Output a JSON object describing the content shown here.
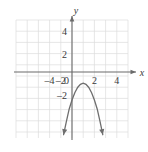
{
  "chart_data": {
    "type": "line",
    "title": "",
    "subtitle": "",
    "xlabel": "x",
    "ylabel": "y",
    "xlim": [
      -5.2,
      4.8
    ],
    "ylim": [
      -5.3,
      4.8
    ],
    "grid": true,
    "legend": null,
    "x_ticks": [
      -4,
      -2,
      0,
      2,
      4
    ],
    "x_tick_labels": [
      "–4",
      "–2",
      "0",
      "2",
      "4"
    ],
    "y_ticks": [
      4,
      2,
      -2
    ],
    "y_tick_labels": [
      "4",
      "2",
      "–2"
    ],
    "grid_step": 1,
    "series": [
      {
        "name": "downward parabola",
        "kind": "parabola",
        "opens": "down",
        "vertex": [
          1,
          -1
        ],
        "leading_coefficient": -1.5,
        "y_intercept": -2.5,
        "arrow_start": true,
        "arrow_end": true,
        "x_domain": [
          -0.75,
          2.75
        ],
        "points": [
          [
            -0.75,
            -5.6
          ],
          [
            -0.5,
            -4.4
          ],
          [
            -0.25,
            -3.3
          ],
          [
            0,
            -2.5
          ],
          [
            0.25,
            -1.85
          ],
          [
            0.5,
            -1.38
          ],
          [
            0.75,
            -1.1
          ],
          [
            1,
            -1
          ],
          [
            1.25,
            -1.1
          ],
          [
            1.5,
            -1.38
          ],
          [
            1.75,
            -1.85
          ],
          [
            2,
            -2.5
          ],
          [
            2.25,
            -3.3
          ],
          [
            2.5,
            -4.4
          ],
          [
            2.75,
            -5.6
          ]
        ]
      }
    ],
    "colors": {
      "grid": "#dcdcdc",
      "axis": "#6b6b6b",
      "curve": "#6e6e6e",
      "text": "#3a3a3a",
      "background": "#ffffff"
    }
  },
  "axes": {
    "x_axis_label": "x",
    "y_axis_label": "y"
  }
}
